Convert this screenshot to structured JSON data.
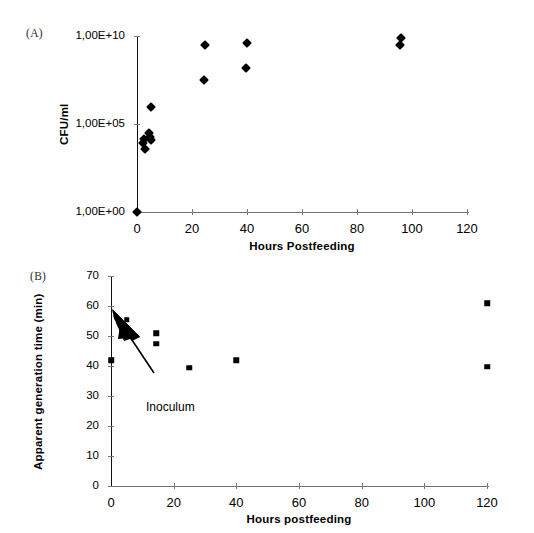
{
  "figure": {
    "panel_a_label": "(A)",
    "panel_b_label": "(B)"
  },
  "chart_data": [
    {
      "type": "scatter",
      "panel": "(A)",
      "title": "",
      "xlabel": "Hours Postfeeding",
      "ylabel": "CFU/ml",
      "xlim": [
        0,
        120
      ],
      "xticks": [
        0,
        20,
        40,
        60,
        80,
        100,
        120
      ],
      "xticklabels": [
        "0",
        "20",
        "40",
        "60",
        "80",
        "100",
        "120"
      ],
      "yscale": "log",
      "ylim": [
        1,
        10000000000
      ],
      "yticks": [
        1,
        100000,
        10000000000
      ],
      "yticklabels": [
        "1,00E+00",
        "1,00E+05",
        "1,00E+10"
      ],
      "grid": false,
      "legend": "none",
      "marker": "diamond",
      "points": [
        {
          "x": 0,
          "y": 1
        },
        {
          "x": 2,
          "y": 8000
        },
        {
          "x": 2.5,
          "y": 15000
        },
        {
          "x": 3,
          "y": 4000
        },
        {
          "x": 4.5,
          "y": 30000
        },
        {
          "x": 4.8,
          "y": 18000
        },
        {
          "x": 5,
          "y": 12000
        },
        {
          "x": 5.2,
          "y": 900000
        },
        {
          "x": 24.5,
          "y": 30000000
        },
        {
          "x": 24.8,
          "y": 3000000000
        },
        {
          "x": 39.8,
          "y": 150000000
        },
        {
          "x": 40,
          "y": 4000000000
        },
        {
          "x": 95.8,
          "y": 3000000000
        },
        {
          "x": 96,
          "y": 8000000000
        }
      ]
    },
    {
      "type": "scatter",
      "panel": "(B)",
      "title": "",
      "xlabel": "Hours postfeeding",
      "ylabel": "Apparent generation time (min)",
      "xlim": [
        0,
        120
      ],
      "xticks": [
        0,
        20,
        40,
        60,
        80,
        100,
        120
      ],
      "xticklabels": [
        "0",
        "20",
        "40",
        "60",
        "80",
        "100",
        "120"
      ],
      "yscale": "linear",
      "ylim": [
        0,
        70
      ],
      "yticks": [
        0,
        10,
        20,
        30,
        40,
        50,
        60,
        70
      ],
      "yticklabels": [
        "0",
        "10",
        "20",
        "30",
        "40",
        "50",
        "60",
        "70"
      ],
      "grid": false,
      "legend": "none",
      "marker": "square",
      "annotation": "Inoculum",
      "points": [
        {
          "x": 0,
          "y": 42
        },
        {
          "x": 5,
          "y": 55.5
        },
        {
          "x": 14.5,
          "y": 51
        },
        {
          "x": 14.5,
          "y": 47.5
        },
        {
          "x": 25,
          "y": 39.5
        },
        {
          "x": 40,
          "y": 42
        },
        {
          "x": 120,
          "y": 61
        },
        {
          "x": 120,
          "y": 39.8
        }
      ]
    }
  ]
}
